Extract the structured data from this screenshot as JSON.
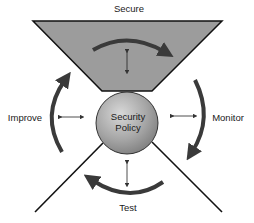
{
  "diagram": {
    "center": {
      "line1": "Security",
      "line2": "Policy"
    },
    "phases": {
      "top": "Secure",
      "right": "Monitor",
      "bottom": "Test",
      "left": "Improve"
    },
    "colors": {
      "wedge_fill": "#9a9a9a",
      "circle_fill": "#a8a8a8",
      "circle_highlight": "#d6d6d6",
      "lines": "#111111",
      "arrows": "#3a3a3a"
    }
  }
}
